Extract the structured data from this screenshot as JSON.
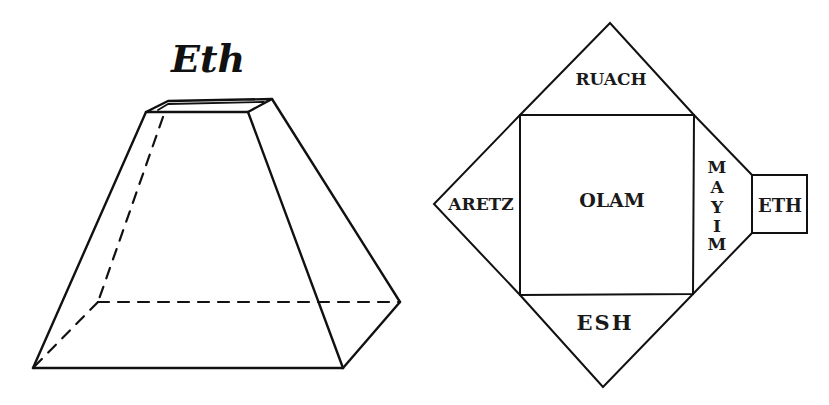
{
  "left_figure": {
    "title": "Eth",
    "shape": "truncated square pyramid (frustum) in perspective, hidden edges dashed"
  },
  "right_figure": {
    "shape": "unfolded net of the frustum",
    "center_label": "OLAM",
    "top_label": "RUACH",
    "left_label": "ARETZ",
    "bottom_label": "ESH",
    "right_label": "MAYIM",
    "right_label_letters": [
      "M",
      "A",
      "Y",
      "I",
      "M"
    ],
    "cap_label": "ETH"
  },
  "colors": {
    "ink": "#111111",
    "background": "#ffffff"
  }
}
